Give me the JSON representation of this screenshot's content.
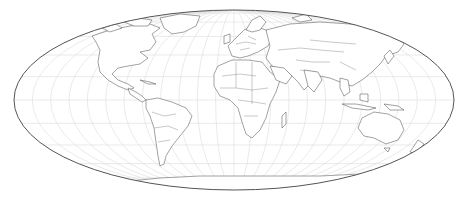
{
  "map": {
    "projection": "hammer-mollweide",
    "center": [
      234,
      100
    ],
    "radii": [
      220,
      90
    ],
    "graticule_step_deg": 15,
    "colors": {
      "background": "#ffffff",
      "land_fill": "#ffffff",
      "coastline": "#555555",
      "borders": "#777777",
      "graticule": "#dcdcdc",
      "outline": "#555555"
    },
    "layers": [
      "graticule",
      "countries",
      "outline"
    ]
  }
}
